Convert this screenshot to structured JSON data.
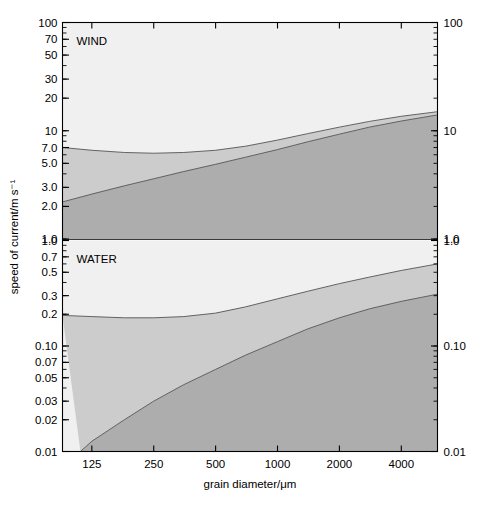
{
  "figure": {
    "background_color": "#ffffff",
    "width": 488,
    "height": 507
  },
  "axes": {
    "y_axis_title": "speed of current/m s⁻¹",
    "x_axis_title": "grain diameter/μm",
    "x_tick_labels": [
      "125",
      "250",
      "500",
      "1000",
      "2000",
      "4000"
    ],
    "x_tick_values": [
      125,
      250,
      500,
      1000,
      2000,
      4000
    ],
    "left_y_ticks_top_panel": [
      "100",
      "70",
      "50",
      "30",
      "20",
      "10",
      "7.0",
      "5.0",
      "3.0",
      "2.0",
      "1.0"
    ],
    "left_y_ticks_bottom_panel": [
      "1.0",
      "0.7",
      "0.5",
      "0.3",
      "0.2",
      "0.10",
      "0.07",
      "0.05",
      "0.03",
      "0.02",
      "0.01"
    ],
    "right_y_ticks_top_panel": [
      "100",
      "10",
      "1.0"
    ],
    "right_y_ticks_bottom_panel": [
      "1.0",
      "0.10",
      "0.01"
    ]
  },
  "panels": [
    {
      "id": "wind-panel",
      "title": "WIND",
      "y_min": 1.0,
      "y_max": 100,
      "zones": [
        {
          "name": "erosion-zone",
          "label": "erosion zone",
          "color": "#f0f0f0"
        },
        {
          "name": "transportation-zone",
          "label": "transportation zone",
          "color": "#cccccc"
        },
        {
          "name": "deposition-zone",
          "label": "deposition zone",
          "color": "#adadad"
        }
      ],
      "boundaries": [
        {
          "name": "grains-picked-up",
          "label": "grains picked up"
        },
        {
          "name": "grains-deposited",
          "label": "grains deposited"
        }
      ]
    },
    {
      "id": "water-panel",
      "title": "WATER",
      "y_min": 0.01,
      "y_max": 1.0,
      "zones": [
        {
          "name": "erosion-zone",
          "label": "erosion zone",
          "color": "#f0f0f0"
        },
        {
          "name": "transportation-zone",
          "label": "transportation zone",
          "color": "#cccccc"
        },
        {
          "name": "deposition-zone",
          "label": "deposition zone",
          "color": "#adadad"
        }
      ],
      "boundaries": [
        {
          "name": "grains-picked-up",
          "label": "grains picked up"
        },
        {
          "name": "grains-deposited",
          "label": "grains deposited"
        }
      ]
    }
  ],
  "chart_data": {
    "type": "area",
    "title": "",
    "subtitle": "",
    "xlabel": "grain diameter/μm",
    "ylabel": "speed of current/m s⁻¹",
    "xscale": "log",
    "yscale": "log",
    "xlim": [
      90,
      6000
    ],
    "x_tick_labels": [
      "125",
      "250",
      "500",
      "1000",
      "2000",
      "4000"
    ],
    "grid": false,
    "legend": "none",
    "annotations": [
      "WIND",
      "WATER",
      "erosion zone",
      "transportation zone",
      "deposition zone",
      "grains picked up",
      "grains deposited"
    ],
    "panels": [
      {
        "name": "WIND",
        "ylim": [
          1.0,
          100
        ],
        "y_tick_labels_left": [
          "100",
          "70",
          "50",
          "30",
          "20",
          "10",
          "7.0",
          "5.0",
          "3.0",
          "2.0",
          "1.0"
        ],
        "y_tick_values_left": [
          100,
          70,
          50,
          30,
          20,
          10,
          7.0,
          5.0,
          3.0,
          2.0,
          1.0
        ],
        "y_tick_labels_right": [
          "100",
          "10",
          "1.0"
        ],
        "y_tick_values_right": [
          100,
          10,
          1.0
        ],
        "series": [
          {
            "name": "grains picked up",
            "description": "upper boundary: erosion zone above, transportation zone below",
            "x": [
              90,
              125,
              180,
              250,
              350,
              500,
              700,
              1000,
              1400,
              2000,
              2800,
              4000,
              6000
            ],
            "y": [
              7.0,
              6.6,
              6.3,
              6.2,
              6.3,
              6.6,
              7.2,
              8.2,
              9.4,
              10.8,
              12.2,
              13.6,
              15.0
            ]
          },
          {
            "name": "grains deposited",
            "description": "lower boundary: transportation zone above, deposition zone below",
            "x": [
              90,
              125,
              180,
              250,
              350,
              500,
              700,
              1000,
              1400,
              2000,
              2800,
              4000,
              6000
            ],
            "y": [
              2.2,
              2.6,
              3.1,
              3.6,
              4.2,
              4.9,
              5.7,
              6.7,
              7.9,
              9.3,
              10.8,
              12.3,
              14.0
            ]
          }
        ]
      },
      {
        "name": "WATER",
        "ylim": [
          0.01,
          1.0
        ],
        "y_tick_labels_left": [
          "1.0",
          "0.7",
          "0.5",
          "0.3",
          "0.2",
          "0.10",
          "0.07",
          "0.05",
          "0.03",
          "0.02",
          "0.01"
        ],
        "y_tick_values_left": [
          1.0,
          0.7,
          0.5,
          0.3,
          0.2,
          0.1,
          0.07,
          0.05,
          0.03,
          0.02,
          0.01
        ],
        "y_tick_labels_right": [
          "1.0",
          "0.10",
          "0.01"
        ],
        "y_tick_values_right": [
          1.0,
          0.1,
          0.01
        ],
        "series": [
          {
            "name": "grains picked up",
            "description": "upper boundary: erosion zone above, transportation zone below",
            "x": [
              90,
              125,
              180,
              250,
              350,
              500,
              700,
              1000,
              1400,
              2000,
              2800,
              4000,
              6000
            ],
            "y": [
              0.195,
              0.19,
              0.185,
              0.185,
              0.19,
              0.205,
              0.235,
              0.28,
              0.33,
              0.39,
              0.45,
              0.52,
              0.6
            ]
          },
          {
            "name": "grains deposited",
            "description": "lower boundary: transportation zone above, deposition zone below",
            "x": [
              110,
              125,
              180,
              250,
              350,
              500,
              700,
              1000,
              1400,
              2000,
              2800,
              4000,
              6000
            ],
            "y": [
              0.01,
              0.0125,
              0.02,
              0.03,
              0.043,
              0.06,
              0.082,
              0.11,
              0.145,
              0.185,
              0.225,
              0.265,
              0.31
            ]
          }
        ]
      }
    ]
  },
  "colors": {
    "erosion_zone": "#f0f0f0",
    "transportation_zone": "#cccccc",
    "deposition_zone": "#adadad",
    "axis": "#000000",
    "curve": "#555555",
    "background": "#ffffff"
  }
}
